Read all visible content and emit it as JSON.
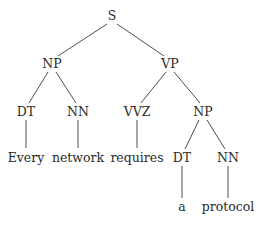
{
  "diagram": {
    "type": "parse-tree",
    "sentence": "Every network requires a protocol",
    "nodes": [
      {
        "id": "s",
        "label": "S",
        "x": 112,
        "y": 16,
        "kind": "nonterminal"
      },
      {
        "id": "np1",
        "label": "NP",
        "x": 52,
        "y": 64,
        "kind": "nonterminal"
      },
      {
        "id": "vp",
        "label": "VP",
        "x": 170,
        "y": 64,
        "kind": "nonterminal"
      },
      {
        "id": "dt1",
        "label": "DT",
        "x": 26,
        "y": 112,
        "kind": "preterminal"
      },
      {
        "id": "nn1",
        "label": "NN",
        "x": 78,
        "y": 112,
        "kind": "preterminal"
      },
      {
        "id": "vvz",
        "label": "VVZ",
        "x": 137,
        "y": 112,
        "kind": "preterminal"
      },
      {
        "id": "np2",
        "label": "NP",
        "x": 203,
        "y": 112,
        "kind": "nonterminal"
      },
      {
        "id": "every",
        "label": "Every",
        "x": 26,
        "y": 158,
        "kind": "terminal"
      },
      {
        "id": "network",
        "label": "network",
        "x": 78,
        "y": 158,
        "kind": "terminal"
      },
      {
        "id": "requires",
        "label": "requires",
        "x": 137,
        "y": 158,
        "kind": "terminal"
      },
      {
        "id": "dt2",
        "label": "DT",
        "x": 182,
        "y": 158,
        "kind": "preterminal"
      },
      {
        "id": "nn2",
        "label": "NN",
        "x": 228,
        "y": 158,
        "kind": "preterminal"
      },
      {
        "id": "a",
        "label": "a",
        "x": 182,
        "y": 207,
        "kind": "terminal"
      },
      {
        "id": "protocol",
        "label": "protocol",
        "x": 228,
        "y": 207,
        "kind": "terminal"
      }
    ],
    "edges": [
      {
        "from": "s",
        "to": "np1",
        "x1": 107,
        "y1": 24,
        "x2": 58,
        "y2": 56
      },
      {
        "from": "s",
        "to": "vp",
        "x1": 117,
        "y1": 24,
        "x2": 164,
        "y2": 56
      },
      {
        "from": "np1",
        "to": "dt1",
        "x1": 48,
        "y1": 72,
        "x2": 29,
        "y2": 103
      },
      {
        "from": "np1",
        "to": "nn1",
        "x1": 56,
        "y1": 72,
        "x2": 76,
        "y2": 103
      },
      {
        "from": "vp",
        "to": "vvz",
        "x1": 166,
        "y1": 72,
        "x2": 141,
        "y2": 103
      },
      {
        "from": "vp",
        "to": "np2",
        "x1": 174,
        "y1": 72,
        "x2": 200,
        "y2": 103
      },
      {
        "from": "dt1",
        "to": "every",
        "x1": 26,
        "y1": 120,
        "x2": 26,
        "y2": 148
      },
      {
        "from": "nn1",
        "to": "network",
        "x1": 78,
        "y1": 120,
        "x2": 78,
        "y2": 148
      },
      {
        "from": "vvz",
        "to": "requires",
        "x1": 137,
        "y1": 120,
        "x2": 137,
        "y2": 148
      },
      {
        "from": "np2",
        "to": "dt2",
        "x1": 199,
        "y1": 120,
        "x2": 185,
        "y2": 149
      },
      {
        "from": "np2",
        "to": "nn2",
        "x1": 207,
        "y1": 120,
        "x2": 225,
        "y2": 149
      },
      {
        "from": "dt2",
        "to": "a",
        "x1": 182,
        "y1": 166,
        "x2": 182,
        "y2": 198
      },
      {
        "from": "nn2",
        "to": "protocol",
        "x1": 228,
        "y1": 166,
        "x2": 228,
        "y2": 198
      }
    ]
  }
}
